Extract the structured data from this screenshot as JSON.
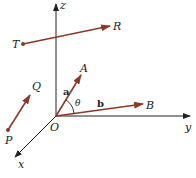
{
  "diagram": {
    "axes": {
      "x": "x",
      "y": "y",
      "z": "z",
      "origin": "O"
    },
    "points": {
      "A": "A",
      "B": "B",
      "P": "P",
      "Q": "Q",
      "T": "T",
      "R": "R"
    },
    "vectors": {
      "a": "a",
      "b": "b"
    },
    "angle": "θ",
    "colors": {
      "vector": "#8B3A2A",
      "axis": "#222222"
    }
  }
}
